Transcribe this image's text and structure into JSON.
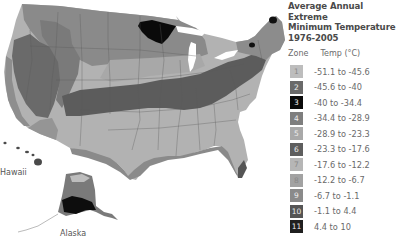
{
  "legend": {
    "title_lines": [
      "Average Annual Extreme",
      "Minimum Temperature",
      "1976-2005"
    ],
    "header_zone": "Zone",
    "header_temp": "Temp (°C)",
    "zones": [
      {
        "zone": "1",
        "range": "-51.1 to -45.6",
        "color": "#bdbdbd"
      },
      {
        "zone": "2",
        "range": "-45.6 to -40",
        "color": "#6a6a6a"
      },
      {
        "zone": "3",
        "range": "-40 to -34.4",
        "color": "#0a0a0a"
      },
      {
        "zone": "4",
        "range": "-34.4 to -28.9",
        "color": "#7e7e7e"
      },
      {
        "zone": "5",
        "range": "-28.9 to -23.3",
        "color": "#a9a9a9"
      },
      {
        "zone": "6",
        "range": "-23.3 to -17.6",
        "color": "#5e5e5e"
      },
      {
        "zone": "7",
        "range": "-17.6 to -12.2",
        "color": "#b6b6b6"
      },
      {
        "zone": "8",
        "range": "-12.2 to -6.7",
        "color": "#a2a2a2"
      },
      {
        "zone": "9",
        "range": "-6.7 to -1.1",
        "color": "#8a8a8a"
      },
      {
        "zone": "10",
        "range": "-1.1 to 4.4",
        "color": "#555555"
      },
      {
        "zone": "11",
        "range": "4.4 to 10",
        "color": "#1f1f1f"
      }
    ]
  },
  "labels": {
    "hawaii": "Hawaii",
    "alaska": "Alaska"
  }
}
